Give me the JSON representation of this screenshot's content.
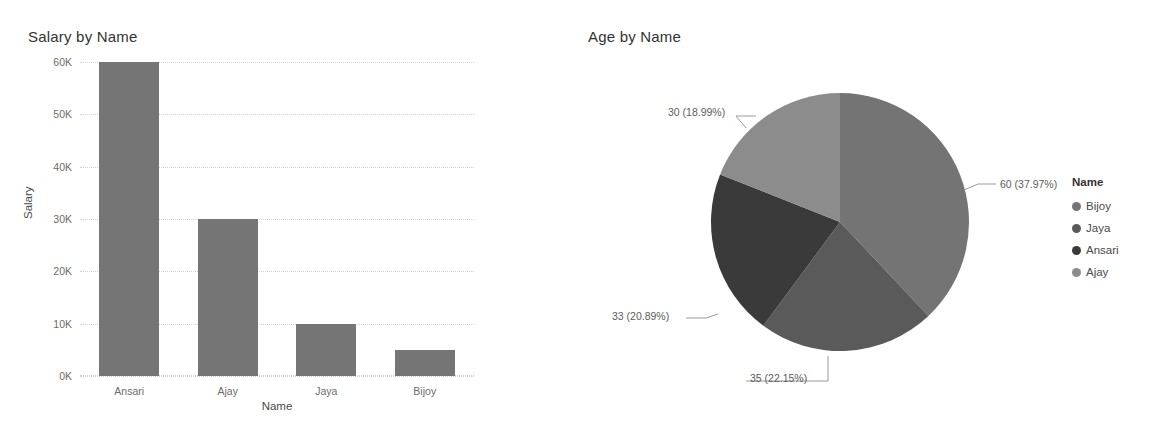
{
  "bar": {
    "title": "Salary by Name",
    "xlabel": "Name",
    "ylabel": "Salary"
  },
  "pie": {
    "title": "Age by Name",
    "legend_title": "Name"
  },
  "legend": {
    "items": [
      {
        "label": "Bijoy",
        "color": "#747474"
      },
      {
        "label": "Jaya",
        "color": "#5a5a5a"
      },
      {
        "label": "Ansari",
        "color": "#3a3a3a"
      },
      {
        "label": "Ajay",
        "color": "#8c8c8c"
      }
    ]
  },
  "chart_data": [
    {
      "type": "bar",
      "title": "Salary by Name",
      "xlabel": "Name",
      "ylabel": "Salary",
      "categories": [
        "Ansari",
        "Ajay",
        "Jaya",
        "Bijoy"
      ],
      "values": [
        60000,
        30000,
        10000,
        5000
      ],
      "ytick_labels": [
        "0K",
        "10K",
        "20K",
        "30K",
        "40K",
        "50K",
        "60K"
      ],
      "ytick_values": [
        0,
        10000,
        20000,
        30000,
        40000,
        50000,
        60000
      ],
      "ylim": [
        0,
        60000
      ],
      "grid": true,
      "legend": "none",
      "bar_color": "#757575"
    },
    {
      "type": "pie",
      "title": "Age by Name",
      "legend_title": "Name",
      "legend_position": "right",
      "labels": [
        "Bijoy",
        "Jaya",
        "Ansari",
        "Ajay"
      ],
      "values": [
        60,
        35,
        33,
        30
      ],
      "total": 158,
      "percentages": [
        37.97,
        22.15,
        20.89,
        18.99
      ],
      "data_labels": [
        "60 (37.97%)",
        "35 (22.15%)",
        "33 (20.89%)",
        "30 (18.99%)"
      ],
      "slice_colors": [
        "#747474",
        "#5a5a5a",
        "#3a3a3a",
        "#8c8c8c"
      ],
      "start_angle_deg": 0,
      "direction": "clockwise"
    }
  ]
}
